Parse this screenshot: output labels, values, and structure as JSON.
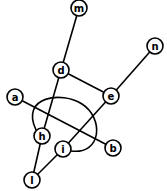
{
  "graph": {
    "nodes": [
      {
        "id": "m",
        "label": "m",
        "x": 79,
        "y": 8
      },
      {
        "id": "n",
        "label": "n",
        "x": 155,
        "y": 46
      },
      {
        "id": "d",
        "label": "d",
        "x": 61,
        "y": 70
      },
      {
        "id": "e",
        "label": "e",
        "x": 111,
        "y": 96
      },
      {
        "id": "a",
        "label": "a",
        "x": 15,
        "y": 97
      },
      {
        "id": "h",
        "label": "h",
        "x": 42,
        "y": 136
      },
      {
        "id": "i",
        "label": "i",
        "x": 63,
        "y": 149
      },
      {
        "id": "b",
        "label": "b",
        "x": 113,
        "y": 148
      },
      {
        "id": "l",
        "label": "l",
        "x": 32,
        "y": 180
      }
    ],
    "edges": [
      {
        "from": "m",
        "to": "d"
      },
      {
        "from": "d",
        "to": "h"
      },
      {
        "from": "d",
        "to": "e"
      },
      {
        "from": "e",
        "to": "n"
      },
      {
        "from": "e",
        "to": "i"
      },
      {
        "from": "a",
        "to": "b"
      },
      {
        "from": "h",
        "to": "l"
      },
      {
        "from": "i",
        "to": "l"
      },
      {
        "from": "h",
        "to": "i",
        "curved": true
      }
    ],
    "node_radius": 8
  }
}
